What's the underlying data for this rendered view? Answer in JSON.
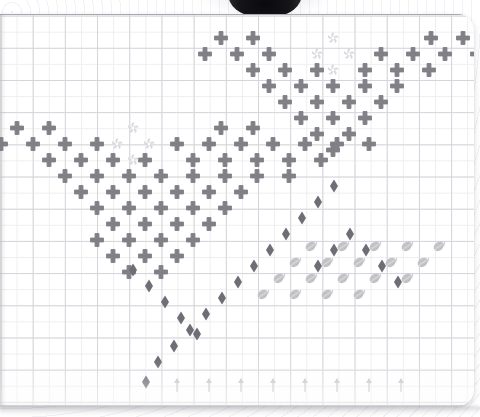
{
  "scene": {
    "title": "Graph paper grid pattern",
    "paper_color": "#ffffff",
    "grid_minor_color": "#eeeef1",
    "grid_major_color": "#d4d4da",
    "cell_size_px": 16.1
  },
  "legend": {
    "cross_label": "cross",
    "diamond_label": "diamond",
    "swirl_label": "swirl",
    "leaf_label": "leaf",
    "arrow_label": "up-arrow"
  },
  "colors": {
    "cross": "#808086",
    "diamond": "#6e6e76",
    "swirl": "#d8d8de",
    "leaf": "#c2c2c8",
    "arrow": "#c6c6cc"
  },
  "chart_data": {
    "type": "scatter",
    "xlabel": "",
    "ylabel": "",
    "grid": true,
    "legend_position": "none",
    "xlim": [
      0,
      480
    ],
    "ylim": [
      0,
      417
    ],
    "series": [
      {
        "name": "cross",
        "marker": "plus",
        "color": "#808086",
        "size": 13,
        "points": [
          [
            221,
            38
          ],
          [
            253,
            38
          ],
          [
            431,
            38
          ],
          [
            463,
            38
          ],
          [
            205,
            54
          ],
          [
            237,
            54
          ],
          [
            269,
            54
          ],
          [
            381,
            54
          ],
          [
            413,
            54
          ],
          [
            445,
            54
          ],
          [
            477,
            54
          ],
          [
            253,
            70
          ],
          [
            285,
            70
          ],
          [
            317,
            70
          ],
          [
            365,
            70
          ],
          [
            397,
            70
          ],
          [
            429,
            70
          ],
          [
            269,
            86
          ],
          [
            301,
            86
          ],
          [
            333,
            86
          ],
          [
            365,
            86
          ],
          [
            397,
            86
          ],
          [
            285,
            102
          ],
          [
            317,
            102
          ],
          [
            349,
            102
          ],
          [
            381,
            102
          ],
          [
            301,
            118
          ],
          [
            333,
            118
          ],
          [
            365,
            118
          ],
          [
            317,
            134
          ],
          [
            349,
            134
          ],
          [
            333,
            150
          ],
          [
            17,
            128
          ],
          [
            49,
            128
          ],
          [
            221,
            128
          ],
          [
            253,
            128
          ],
          [
            1,
            144
          ],
          [
            33,
            144
          ],
          [
            65,
            144
          ],
          [
            97,
            144
          ],
          [
            177,
            144
          ],
          [
            209,
            144
          ],
          [
            241,
            144
          ],
          [
            273,
            144
          ],
          [
            305,
            144
          ],
          [
            337,
            144
          ],
          [
            369,
            144
          ],
          [
            49,
            160
          ],
          [
            81,
            160
          ],
          [
            113,
            160
          ],
          [
            145,
            160
          ],
          [
            193,
            160
          ],
          [
            225,
            160
          ],
          [
            257,
            160
          ],
          [
            289,
            160
          ],
          [
            321,
            160
          ],
          [
            65,
            176
          ],
          [
            97,
            176
          ],
          [
            129,
            176
          ],
          [
            161,
            176
          ],
          [
            193,
            176
          ],
          [
            225,
            176
          ],
          [
            257,
            176
          ],
          [
            289,
            176
          ],
          [
            81,
            192
          ],
          [
            113,
            192
          ],
          [
            145,
            192
          ],
          [
            177,
            192
          ],
          [
            209,
            192
          ],
          [
            241,
            192
          ],
          [
            97,
            208
          ],
          [
            129,
            208
          ],
          [
            161,
            208
          ],
          [
            193,
            208
          ],
          [
            225,
            208
          ],
          [
            113,
            224
          ],
          [
            145,
            224
          ],
          [
            177,
            224
          ],
          [
            209,
            224
          ],
          [
            97,
            240
          ],
          [
            129,
            240
          ],
          [
            161,
            240
          ],
          [
            193,
            240
          ],
          [
            113,
            256
          ],
          [
            145,
            256
          ],
          [
            177,
            256
          ],
          [
            129,
            272
          ],
          [
            161,
            272
          ]
        ]
      },
      {
        "name": "swirl",
        "marker": "pinwheel",
        "color": "#d8d8de",
        "size": 12,
        "points": [
          [
            333,
            38
          ],
          [
            317,
            54
          ],
          [
            349,
            54
          ],
          [
            333,
            70
          ],
          [
            133,
            128
          ],
          [
            117,
            144
          ],
          [
            149,
            144
          ],
          [
            133,
            160
          ]
        ]
      },
      {
        "name": "diamond",
        "marker": "diamond",
        "color": "#6e6e76",
        "size": 13,
        "points": [
          [
            334,
            186
          ],
          [
            318,
            202
          ],
          [
            302,
            218
          ],
          [
            286,
            234
          ],
          [
            270,
            250
          ],
          [
            254,
            266
          ],
          [
            238,
            282
          ],
          [
            222,
            298
          ],
          [
            206,
            314
          ],
          [
            190,
            330
          ],
          [
            174,
            346
          ],
          [
            158,
            362
          ],
          [
            146,
            382
          ],
          [
            133,
            270
          ],
          [
            149,
            286
          ],
          [
            165,
            302
          ],
          [
            181,
            318
          ],
          [
            197,
            334
          ],
          [
            350,
            234
          ],
          [
            366,
            250
          ],
          [
            382,
            266
          ],
          [
            398,
            282
          ],
          [
            318,
            266
          ],
          [
            334,
            250
          ]
        ]
      },
      {
        "name": "leaf",
        "marker": "leaf",
        "color": "#c2c2c8",
        "size": 13,
        "points": [
          [
            311,
            247
          ],
          [
            343,
            247
          ],
          [
            375,
            247
          ],
          [
            407,
            247
          ],
          [
            439,
            247
          ],
          [
            295,
            263
          ],
          [
            327,
            263
          ],
          [
            359,
            263
          ],
          [
            391,
            263
          ],
          [
            423,
            263
          ],
          [
            279,
            279
          ],
          [
            311,
            279
          ],
          [
            343,
            279
          ],
          [
            375,
            279
          ],
          [
            407,
            279
          ],
          [
            263,
            295
          ],
          [
            295,
            295
          ],
          [
            327,
            295
          ],
          [
            359,
            295
          ]
        ]
      },
      {
        "name": "up-arrow",
        "marker": "arrow-up",
        "color": "#c6c6cc",
        "size": 14,
        "points": [
          [
            177,
            385
          ],
          [
            209,
            385
          ],
          [
            241,
            385
          ],
          [
            273,
            385
          ],
          [
            305,
            385
          ],
          [
            337,
            385
          ],
          [
            369,
            385
          ],
          [
            401,
            385
          ]
        ]
      }
    ]
  }
}
